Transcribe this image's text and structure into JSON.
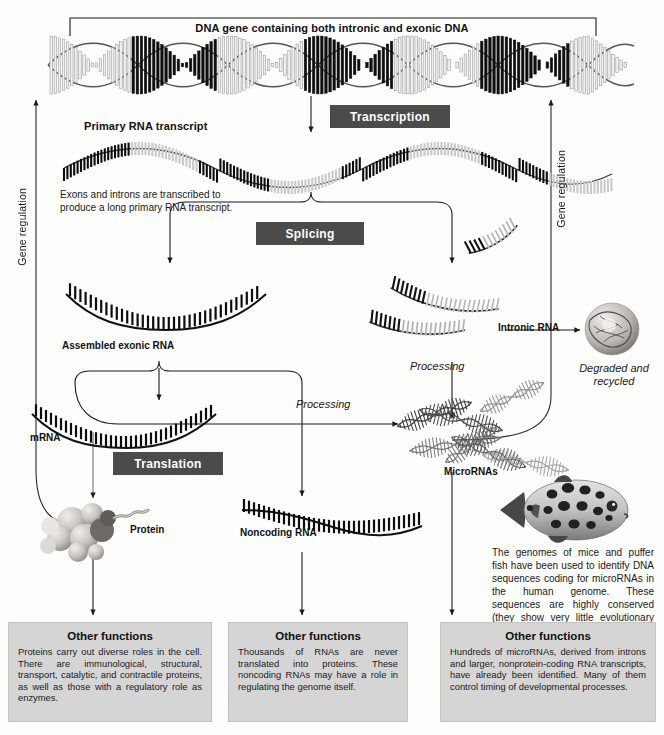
{
  "figure": {
    "title_bracket": "DNA gene containing both intronic and exonic DNA",
    "side_label_left": "Gene regulation",
    "side_label_right": "Gene regulation"
  },
  "process_chips": {
    "transcription": "Transcription",
    "splicing": "Splicing",
    "translation": "Translation",
    "processing_left": "Processing",
    "processing_right": "Processing"
  },
  "labels": {
    "primary_transcript": "Primary RNA transcript",
    "transcript_note": "Exons and introns are transcribed to\nproduce a long primary RNA transcript.",
    "assembled_exonic_rna": "Assembled exonic RNA",
    "intronic_rna": "Intronic RNA",
    "degraded": "Degraded and\nrecycled",
    "mrna": "mRNA",
    "protein": "Protein",
    "noncoding_rna": "Noncoding RNA",
    "micrornas": "MicroRNAs",
    "pufferfish_caption": "The genomes of mice and puffer fish have been used to identify DNA sequences coding for microRNAs in the human genome. These sequences are highly conserved (they show very little evolutionary change)."
  },
  "function_boxes": [
    {
      "heading": "Other functions",
      "body": "Proteins carry out diverse roles in the cell. There are immunological, structural, transport, catalytic, and contractile proteins, as well as those with a regulatory role as enzymes."
    },
    {
      "heading": "Other functions",
      "body": "Thousands of RNAs are never translated into proteins. These noncoding RNAs may have a role in regulating the genome itself."
    },
    {
      "heading": "Other functions",
      "body": "Hundreds of microRNAs, derived from introns and larger, nonprotein-coding RNA transcripts, have already been identified. Many of them control timing of developmental processes."
    }
  ],
  "icons": {
    "dna_double_helix": "dna-helix-icon",
    "rna_strand": "rna-strand-icon",
    "protein_globule": "protein-globule-icon",
    "degraded_blob": "degraded-protein-icon",
    "pufferfish": "pufferfish-icon",
    "microrna_tangle": "microrna-tangle-icon"
  },
  "colors": {
    "chip_bg": "#4b4b4b",
    "chip_text": "#ffffff",
    "panel_bg": "#d5d5d5",
    "ink": "#111111",
    "page_bg": "#fdfdfc"
  }
}
